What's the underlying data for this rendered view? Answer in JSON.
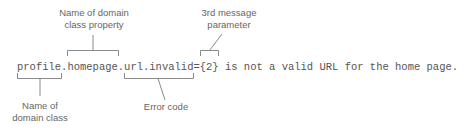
{
  "diagram": {
    "code_line": "profile.homepage.url.invalid={2} is not a valid URL for the home page.",
    "segments": {
      "domain_class": "profile",
      "domain_class_property": "homepage",
      "error_code": "url.invalid",
      "message_parameter": "{2}"
    },
    "annotations": {
      "property_label_line1": "Name of domain",
      "property_label_line2": "class property",
      "param_label_line1": "3rd message",
      "param_label_line2": "parameter",
      "class_label_line1": "Name of",
      "class_label_line2": "domain class",
      "error_code_label": "Error code"
    },
    "colors": {
      "text": "#555555",
      "label": "#666666",
      "connector": "#8a8a8a"
    }
  }
}
